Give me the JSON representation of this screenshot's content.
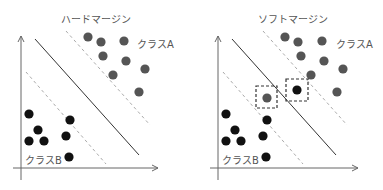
{
  "panels": [
    {
      "title": "ハードマージン",
      "class_a_label": "クラスA",
      "class_b_label": "クラスB",
      "offset_x": 0,
      "highlight_boxes": []
    },
    {
      "title": "ソフトマージン",
      "class_a_label": "クラスA",
      "class_b_label": "クラスB",
      "offset_x": 200,
      "highlight_boxes": [
        {
          "x": 257,
          "y": 84,
          "w": 20,
          "h": 20,
          "point": "class_a",
          "cx": 267,
          "cy": 97
        },
        {
          "x": 287,
          "y": 79,
          "w": 20,
          "h": 21,
          "point": "class_b",
          "cx": 297,
          "cy": 90
        }
      ]
    }
  ],
  "colors": {
    "class_a": "#555555",
    "class_b": "#111111",
    "axis": "#666666",
    "decision_line": "#333333",
    "margin_line": "#aaaaaa"
  }
}
